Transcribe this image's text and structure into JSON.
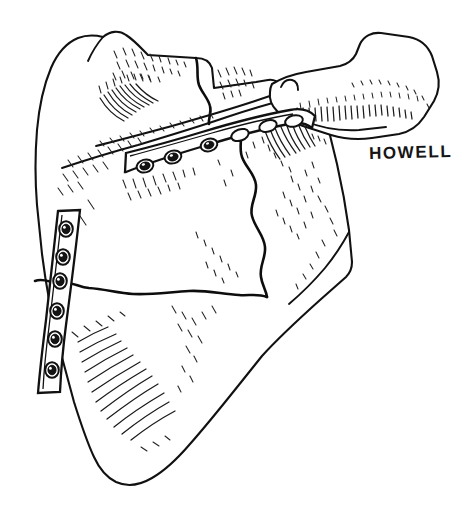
{
  "figure": {
    "view": "posterior",
    "medium": "pen-and-ink line drawing",
    "background_color": "#ffffff",
    "ink_color": "#111111",
    "signature": "HOWELL"
  },
  "anatomy": {
    "regions": [
      {
        "name": "supraspinous-fossa",
        "label": "Supraspinous fossa"
      },
      {
        "name": "infraspinous-fossa",
        "label": "Infraspinous fossa"
      },
      {
        "name": "scapular-spine",
        "label": "Scapular spine"
      },
      {
        "name": "acromion",
        "label": "Acromion process"
      },
      {
        "name": "glenoid-neck",
        "label": "Glenoid neck"
      },
      {
        "name": "medial-border",
        "label": "Medial border"
      },
      {
        "name": "lateral-border",
        "label": "Lateral border"
      },
      {
        "name": "inferior-angle",
        "label": "Inferior angle"
      },
      {
        "name": "superior-angle",
        "label": "Superior angle"
      }
    ]
  },
  "fractures": [
    {
      "name": "superior-body-fracture",
      "orientation": "vertical",
      "location": "supraspinous fossa"
    },
    {
      "name": "intermediate-oblique-fracture",
      "orientation": "vertical-wavy",
      "location": "infraspinous fossa"
    },
    {
      "name": "transverse-body-fracture",
      "orientation": "horizontal",
      "location": "mid body to lateral border"
    }
  ],
  "implants": {
    "spine_plate": {
      "name": "Scapular spine plate",
      "orientation": "oblique along scapular spine",
      "screw_count": 6,
      "screw_holes": [
        {
          "index": 1,
          "filled": true
        },
        {
          "index": 2,
          "filled": true
        },
        {
          "index": 3,
          "filled": true
        },
        {
          "index": 4,
          "filled": false
        },
        {
          "index": 5,
          "filled": false
        },
        {
          "index": 6,
          "filled": false
        }
      ]
    },
    "lateral_border_plate": {
      "name": "Lateral border plate",
      "orientation": "vertical along lateral border",
      "screw_count": 6,
      "screw_holes": [
        {
          "index": 1,
          "filled": true
        },
        {
          "index": 2,
          "filled": true
        },
        {
          "index": 3,
          "filled": true
        },
        {
          "index": 4,
          "filled": true
        },
        {
          "index": 5,
          "filled": true
        },
        {
          "index": 6,
          "filled": true
        }
      ]
    }
  }
}
